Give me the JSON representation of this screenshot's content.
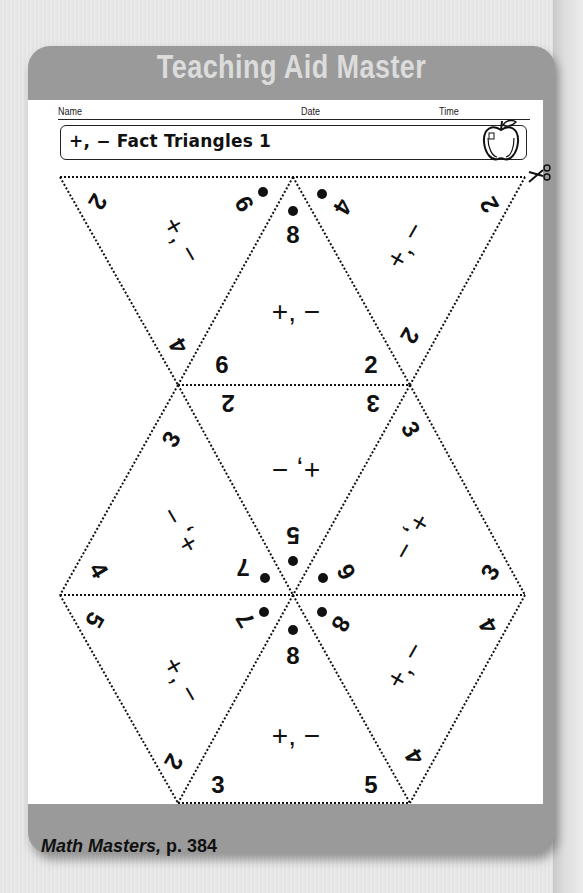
{
  "header": {
    "title": "Teaching Aid Master"
  },
  "meta_fields": {
    "name_label": "Name",
    "date_label": "Date",
    "time_label": "Time"
  },
  "worksheet": {
    "title": "+, − Fact Triangles 1",
    "icon": "apple-icon",
    "cut_icon": "scissors-icon"
  },
  "triangles": [
    {
      "id": 1,
      "orientation": "down",
      "corners": [
        "2",
        "9",
        "4"
      ],
      "sum_dot": "9",
      "operations": "+, −"
    },
    {
      "id": 2,
      "orientation": "up",
      "corners": [
        "8",
        "6",
        "2"
      ],
      "sum_dot": "8",
      "operations": "+, −"
    },
    {
      "id": 3,
      "orientation": "down",
      "corners": [
        "4",
        "2",
        "2"
      ],
      "sum_dot": "4",
      "operations": "+, −"
    },
    {
      "id": 4,
      "orientation": "down-inverted",
      "corners": [
        "2",
        "3",
        "5"
      ],
      "sum_dot": "5",
      "operations": "+, −"
    },
    {
      "id": 5,
      "orientation": "up",
      "corners": [
        "3",
        "4",
        "7"
      ],
      "sum_dot": "7",
      "operations": "+, −"
    },
    {
      "id": 6,
      "orientation": "up",
      "corners": [
        "3",
        "6",
        "3"
      ],
      "sum_dot": "6",
      "operations": "+, −"
    },
    {
      "id": 7,
      "orientation": "down",
      "corners": [
        "5",
        "7",
        "2"
      ],
      "sum_dot": "7",
      "operations": "+, −"
    },
    {
      "id": 8,
      "orientation": "up",
      "corners": [
        "8",
        "3",
        "5"
      ],
      "sum_dot": "8",
      "operations": "+, −"
    },
    {
      "id": 9,
      "orientation": "down",
      "corners": [
        "8",
        "4",
        "4"
      ],
      "sum_dot": "8",
      "operations": "+, −"
    }
  ],
  "labels": {
    "t1_a": "2",
    "t1_b": "9",
    "t1_c": "4",
    "t1_ops": "+, −",
    "t2_a": "8",
    "t2_b": "6",
    "t2_c": "2",
    "t2_ops": "+, −",
    "t3_a": "4",
    "t3_b": "2",
    "t3_c": "2",
    "t3_ops": "+, −",
    "t4_a": "2",
    "t4_b": "3",
    "t4_c": "5",
    "t4_ops": "+, −",
    "t5_a": "3",
    "t5_b": "4",
    "t5_c": "7",
    "t5_ops": "+, −",
    "t6_a": "3",
    "t6_b": "6",
    "t6_c": "3",
    "t6_ops": "+, −",
    "t7_a": "5",
    "t7_b": "7",
    "t7_c": "2",
    "t7_ops": "+, −",
    "t8_a": "8",
    "t8_b": "3",
    "t8_c": "5",
    "t8_ops": "+, −",
    "t9_a": "8",
    "t9_b": "4",
    "t9_c": "4",
    "t9_ops": "+, −"
  },
  "footer": {
    "source_title": "Math Masters,",
    "page": " p. 384"
  },
  "colors": {
    "frame": "#9a9a9a",
    "header_text": "#dcdcdc",
    "sheet": "#ffffff",
    "ink": "#111111"
  }
}
